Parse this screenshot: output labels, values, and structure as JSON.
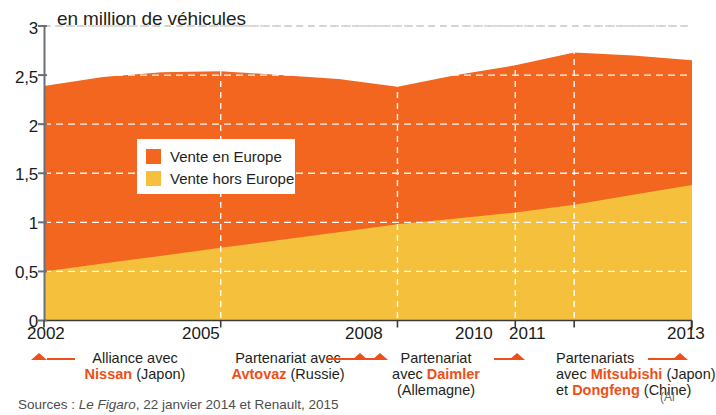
{
  "chart_data": {
    "type": "area",
    "title": "en million de véhicules",
    "xlabel": "",
    "ylabel": "en million de véhicules",
    "ylim": [
      0,
      3
    ],
    "yticks": [
      "0",
      "0,5",
      "1",
      "1,5",
      "2",
      "2,5",
      "3"
    ],
    "ytick_values": [
      0,
      0.5,
      1,
      1.5,
      2,
      2.5,
      3
    ],
    "xticks": [
      "2002",
      "2005",
      "2008",
      "2010",
      "2011",
      "2013"
    ],
    "xtick_values": [
      2002,
      2005,
      2008,
      2010,
      2011,
      2013
    ],
    "x": [
      2002,
      2003,
      2004,
      2005,
      2006,
      2007,
      2008,
      2009,
      2010,
      2011,
      2012,
      2013
    ],
    "stacked": true,
    "grid": true,
    "legend_position": "inside-left",
    "series": [
      {
        "name": "Vente hors Europe",
        "color": "#f5c03c",
        "values": [
          0.5,
          0.58,
          0.66,
          0.74,
          0.82,
          0.9,
          0.98,
          1.04,
          1.1,
          1.18,
          1.28,
          1.38
        ]
      },
      {
        "name": "Vente en Europe",
        "color": "#f2661f",
        "values": [
          1.89,
          1.9,
          1.87,
          1.8,
          1.68,
          1.56,
          1.4,
          1.46,
          1.5,
          1.55,
          1.42,
          1.27
        ]
      }
    ],
    "totals": [
      2.39,
      2.48,
      2.53,
      2.54,
      2.5,
      2.46,
      2.38,
      2.5,
      2.6,
      2.73,
      2.7,
      2.65
    ]
  },
  "chart": {
    "title": "en million de véhicules",
    "legend": [
      {
        "label": "Vente en Europe",
        "color": "#f2661f"
      },
      {
        "label": "Vente hors Europe",
        "color": "#f5c03c"
      }
    ],
    "yticks": [
      "3",
      "2,5",
      "2",
      "1,5",
      "1",
      "0,5",
      "0"
    ],
    "xticks": [
      "2002",
      "2005",
      "2008",
      "2010",
      "2011",
      "2013"
    ]
  },
  "annotations": [
    {
      "id": "nissan",
      "line1_plain": "Alliance avec",
      "line2_brand": "Nissan",
      "line2_plain": " (Japon)",
      "year": "2002"
    },
    {
      "id": "avtovaz",
      "line1_plain": "Partenariat avec",
      "line2_brand": "Avtovaz",
      "line2_plain": " (Russie)",
      "year": "2005"
    },
    {
      "id": "daimler",
      "line1_plain": "Partenariat",
      "line2_plain_pre": "avec ",
      "line2_brand": "Daimler",
      "line3_plain": "(Allemagne)",
      "year": "2008"
    },
    {
      "id": "mitsubishi-dongfeng",
      "line1_plain": "Partenariats",
      "line2_plain_pre": "avec ",
      "line2_brand": "Mitsubishi",
      "line2_plain_post": " (Japon)",
      "line3_plain_pre": "et ",
      "line3_brand": "Dongfeng",
      "line3_plain_post": " (Chine)",
      "year": "2013"
    }
  ],
  "sources": {
    "prefix": "Sources : ",
    "italic": "Le Figaro",
    "suffix": ", 22 janvier 2014 et Renault, 2015"
  },
  "credit": "(Al",
  "colors": {
    "orange": "#f2661f",
    "yellow": "#f5c03c",
    "accent": "#ee4f18",
    "axis": "#6b6f78",
    "text": "#231f20"
  }
}
